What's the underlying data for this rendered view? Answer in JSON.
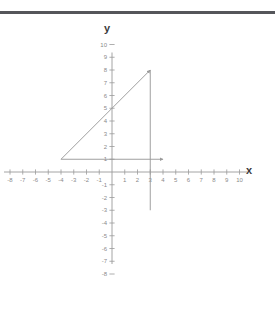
{
  "figure": {
    "kind": "coordinate-plane-triangle",
    "background_color": "#ffffff",
    "top_border_color": "#55565a",
    "line_color": "#9a9a9a",
    "axis_color": "#9a9a9a",
    "tick_label_color": "#8a8a8a",
    "axis_label_color": "#3a3a3a"
  },
  "labels": {
    "x_axis": "x",
    "y_axis": "y"
  },
  "chart_data": {
    "type": "scatter",
    "title": "",
    "subtitle": "",
    "xlabel": "x",
    "ylabel": "y",
    "xlim": [
      -8,
      10
    ],
    "ylim": [
      -8,
      10
    ],
    "grid": false,
    "legend": "none",
    "x_ticks": [
      -8,
      -7,
      -6,
      -5,
      -4,
      -3,
      -2,
      -1,
      1,
      2,
      3,
      4,
      5,
      6,
      7,
      8,
      9,
      10
    ],
    "y_ticks": [
      10,
      9,
      8,
      7,
      6,
      5,
      4,
      3,
      2,
      1,
      -1,
      -2,
      -3,
      -4,
      -5,
      -6,
      -7,
      -8
    ],
    "x_tick_labels": [
      "-8",
      "-7",
      "-6",
      "-5",
      "-4",
      "-3",
      "-2",
      "-1",
      "1",
      "2",
      "3",
      "4",
      "5",
      "6",
      "7",
      "8",
      "9",
      "10"
    ],
    "y_tick_labels": [
      "10",
      "9",
      "8",
      "7",
      "6",
      "5",
      "4",
      "3",
      "2",
      "1",
      "-1",
      "-2",
      "-3",
      "-4",
      "-5",
      "-6",
      "-7",
      "-8"
    ],
    "series": [
      {
        "name": "hypotenuse",
        "kind": "segment",
        "x": [
          -4,
          3
        ],
        "y": [
          1,
          8
        ],
        "arrow_end": true,
        "annotation": "rises from (-4,1) to (3,8); crosses y-axis near y=5"
      },
      {
        "name": "vertical-leg",
        "kind": "segment",
        "x": [
          3,
          3
        ],
        "y": [
          8,
          -3
        ],
        "arrow_end": false,
        "annotation": "vertical line at x=3 from y=8 down to y=-3"
      },
      {
        "name": "horizontal-leg",
        "kind": "segment",
        "x": [
          -4,
          4
        ],
        "y": [
          1,
          1
        ],
        "arrow_end": true,
        "annotation": "horizontal line at y=1 from x=-4 to x=4"
      }
    ],
    "vertices": [
      {
        "label": "left-vertex",
        "x": -4,
        "y": 1
      },
      {
        "label": "apex",
        "x": 3,
        "y": 8
      },
      {
        "label": "right-angle",
        "x": 3,
        "y": 1
      }
    ]
  }
}
